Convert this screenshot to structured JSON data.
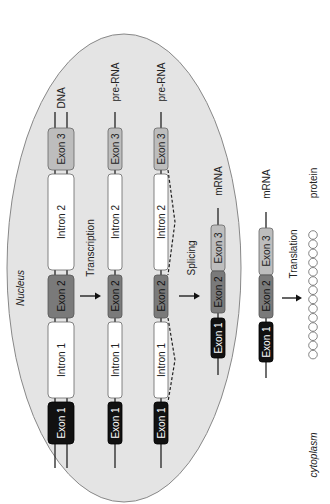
{
  "diagram": {
    "orientation": "rotated 90deg counter-clockwise",
    "compartments": {
      "nucleus_label": "Nucleus",
      "cytoplasm_label": "cytoplasm"
    },
    "colors": {
      "nucleus_fill": "#e4e4e4",
      "nucleus_stroke": "#888888",
      "exon1": "#111111",
      "exon2": "#7a7a7a",
      "exon3": "#bdbdbd",
      "intron": "#ffffff",
      "strand": "#222222"
    },
    "rows": [
      {
        "label": "DNA",
        "segments": [
          "Exon 1",
          "Intron 1",
          "Exon 2",
          "Intron 2",
          "Exon 3"
        ]
      },
      {
        "label": "pre-RNA",
        "segments": [
          "Exon 1",
          "Intron 1",
          "Exon 2",
          "Intron 2",
          "Exon 3"
        ]
      },
      {
        "label": "pre-RNA",
        "segments": [
          "Exon 1",
          "Intron 1",
          "Exon 2",
          "Intron 2",
          "Exon 3"
        ],
        "note": "dashed splice loops over introns"
      },
      {
        "label": "mRNA",
        "segments": [
          "Exon 1",
          "Exon 2",
          "Exon 3"
        ]
      },
      {
        "label": "mRNA",
        "segments": [
          "Exon 1",
          "Exon 2",
          "Exon 3"
        ]
      },
      {
        "label": "protein",
        "circle_count": 14
      }
    ],
    "steps": [
      {
        "label": "Transcription"
      },
      {
        "label": "Splicing"
      },
      {
        "label": "Translation"
      }
    ]
  }
}
